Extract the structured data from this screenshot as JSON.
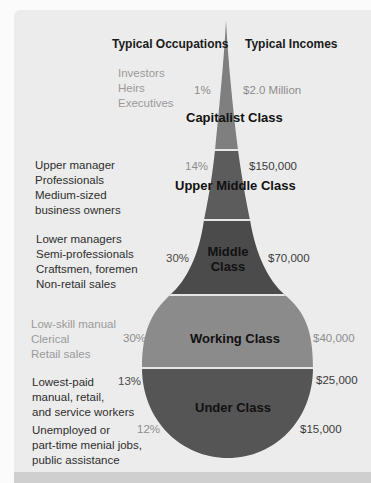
{
  "headers": {
    "occupations": "Typical Occupations",
    "incomes": "Typical Incomes"
  },
  "classes": [
    {
      "name": "Capitalist Class",
      "percent": "1%",
      "income": "$2.0 Million",
      "occupations": [
        "Investors",
        "Heirs",
        "Executives"
      ],
      "color": "#7f7f7f"
    },
    {
      "name": "Upper Middle Class",
      "percent": "14%",
      "income": "$150,000",
      "occupations": [
        "Upper manager",
        "Professionals",
        "Medium-sized",
        "business owners"
      ],
      "color": "#5c5c5c"
    },
    {
      "name_line1": "Middle",
      "name_line2": "Class",
      "name": "Middle Class",
      "percent": "30%",
      "income": "$70,000",
      "occupations": [
        "Lower managers",
        "Semi-professionals",
        "Craftsmen, foremen",
        "Non-retail sales"
      ],
      "color": "#4b4b4b"
    },
    {
      "name": "Working Class",
      "percent": "30%",
      "income": "$40,000",
      "occupations": [
        "Low-skill manual",
        "Clerical",
        "Retail sales"
      ],
      "color": "#8b8b8b"
    },
    {
      "name": "Under Class",
      "groups": [
        {
          "percent": "13%",
          "income": "$25,000",
          "occupations": [
            "Lowest-paid",
            "manual, retail,",
            "and service workers"
          ]
        },
        {
          "percent": "12%",
          "income": "$15,000",
          "occupations": [
            "Unemployed or",
            "part-time menial jobs,",
            "public assistance"
          ]
        }
      ],
      "color": "#555555"
    }
  ],
  "colors": {
    "panel_bg": "#ececec",
    "separator": "#e8e8e8"
  }
}
